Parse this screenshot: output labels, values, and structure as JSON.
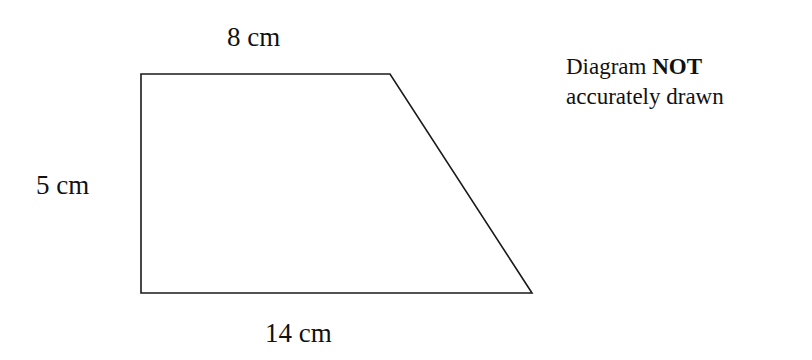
{
  "diagram": {
    "type": "trapezium",
    "shape_color": "#1a1a1a",
    "vertices": [
      [
        141,
        74
      ],
      [
        390,
        74
      ],
      [
        532,
        293
      ],
      [
        141,
        293
      ]
    ],
    "labels": {
      "top": "8 cm",
      "left": "5 cm",
      "bottom": "14 cm"
    },
    "note": {
      "prefix": "Diagram",
      "emphasis": "NOT",
      "line2": "accurately drawn"
    }
  }
}
